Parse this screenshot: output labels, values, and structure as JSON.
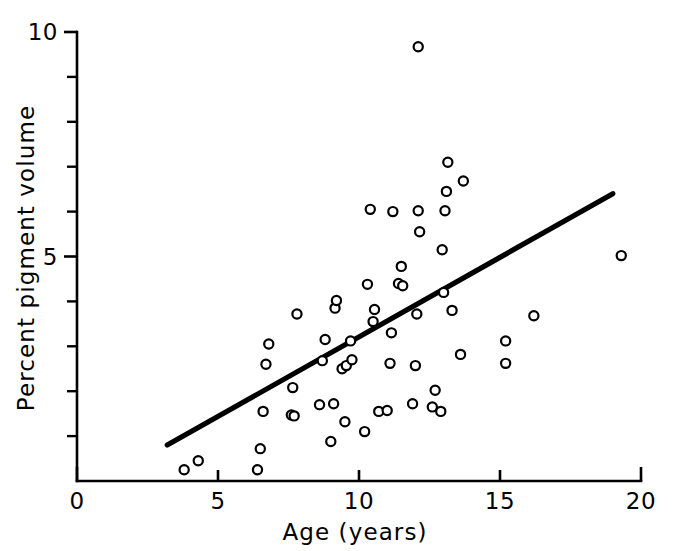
{
  "chart_data": {
    "type": "scatter",
    "title": "",
    "xlabel": "Age (years)",
    "ylabel": "Percent pigment volume",
    "xlim": [
      0,
      20
    ],
    "ylim": [
      0,
      10
    ],
    "xticks": [
      0,
      5,
      10,
      15,
      20
    ],
    "xtick_labels": [
      "0",
      "5",
      "10",
      "15",
      "20"
    ],
    "yticks": [
      5,
      10
    ],
    "ytick_labels": [
      "5",
      "10"
    ],
    "yticks_minor": [
      1,
      2,
      3,
      4,
      6,
      7,
      8,
      9
    ],
    "grid": false,
    "legend": "none",
    "marker": "open-circle",
    "series": [
      {
        "name": "subjects",
        "points": [
          [
            3.8,
            0.25
          ],
          [
            4.3,
            0.45
          ],
          [
            6.4,
            0.25
          ],
          [
            6.5,
            0.72
          ],
          [
            6.6,
            1.55
          ],
          [
            6.7,
            2.6
          ],
          [
            6.8,
            3.05
          ],
          [
            7.6,
            1.47
          ],
          [
            7.7,
            1.45
          ],
          [
            7.65,
            2.08
          ],
          [
            7.8,
            3.72
          ],
          [
            8.6,
            1.7
          ],
          [
            8.7,
            2.68
          ],
          [
            8.8,
            3.15
          ],
          [
            9.0,
            0.88
          ],
          [
            9.1,
            1.72
          ],
          [
            9.15,
            3.85
          ],
          [
            9.2,
            4.02
          ],
          [
            9.4,
            2.5
          ],
          [
            9.5,
            1.32
          ],
          [
            9.55,
            2.57
          ],
          [
            9.7,
            3.12
          ],
          [
            9.75,
            2.7
          ],
          [
            10.2,
            1.1
          ],
          [
            10.3,
            4.38
          ],
          [
            10.4,
            6.05
          ],
          [
            10.5,
            3.55
          ],
          [
            10.55,
            3.82
          ],
          [
            10.7,
            1.55
          ],
          [
            11.0,
            1.57
          ],
          [
            11.1,
            2.62
          ],
          [
            11.15,
            3.3
          ],
          [
            11.2,
            6.0
          ],
          [
            11.4,
            4.4
          ],
          [
            11.5,
            4.78
          ],
          [
            11.55,
            4.35
          ],
          [
            11.9,
            1.72
          ],
          [
            12.0,
            2.57
          ],
          [
            12.05,
            3.72
          ],
          [
            12.1,
            6.02
          ],
          [
            12.15,
            5.55
          ],
          [
            12.1,
            9.67
          ],
          [
            12.6,
            1.65
          ],
          [
            12.7,
            2.02
          ],
          [
            12.9,
            1.55
          ],
          [
            12.95,
            5.15
          ],
          [
            13.0,
            4.2
          ],
          [
            13.05,
            6.02
          ],
          [
            13.1,
            6.45
          ],
          [
            13.15,
            7.1
          ],
          [
            13.3,
            3.8
          ],
          [
            13.6,
            2.82
          ],
          [
            13.7,
            6.68
          ],
          [
            15.2,
            2.62
          ],
          [
            15.2,
            3.12
          ],
          [
            16.2,
            3.68
          ],
          [
            19.3,
            5.02
          ]
        ]
      }
    ],
    "trend_line": {
      "x0": 3.2,
      "y0": 0.8,
      "x1": 19.0,
      "y1": 6.4
    }
  },
  "axes": {
    "x_label": "Age (years)",
    "y_label": "Percent pigment volume"
  }
}
